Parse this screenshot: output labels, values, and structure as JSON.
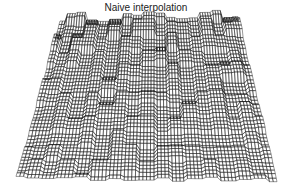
{
  "chart_data": {
    "type": "surface",
    "title": "Naive interpolation",
    "xlabel": "",
    "ylabel": "",
    "zlabel": "",
    "grid": false,
    "axes_visible": false,
    "mesh": {
      "rows": 70,
      "cols": 90,
      "edge_color": "#1a1a1a",
      "face_color": "#ffffff",
      "description": "Wireframe 3D surface with blocky, stair-stepped plateaus from nearest-neighbour style interpolation; roughly flat overall with scattered ridges and cliffs"
    },
    "projection": {
      "top_left": [
        60,
        22
      ],
      "top_right": [
        238,
        20
      ],
      "bottom_left": [
        16,
        181
      ],
      "bottom_right": [
        277,
        182
      ]
    }
  }
}
